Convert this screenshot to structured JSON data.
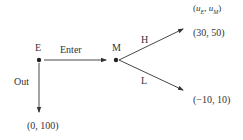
{
  "diagram": {
    "type": "game-tree",
    "nodes": {
      "E": {
        "label": "E"
      },
      "M": {
        "label": "M"
      }
    },
    "edges": {
      "enter": {
        "label": "Enter"
      },
      "out": {
        "label": "Out"
      },
      "high": {
        "label": "H"
      },
      "low": {
        "label": "L"
      }
    },
    "payoff_header": "(u_E, u_M)",
    "payoff_header_parts": {
      "open": "(",
      "u1": "u",
      "s1": "E",
      "sep": ", ",
      "u2": "u",
      "s2": "M",
      "close": ")"
    },
    "payoffs": {
      "high": "(30, 50)",
      "low": "(−10, 10)",
      "out": "(0, 100)"
    },
    "colors": {
      "line": "#333333",
      "text": "#333333"
    }
  }
}
